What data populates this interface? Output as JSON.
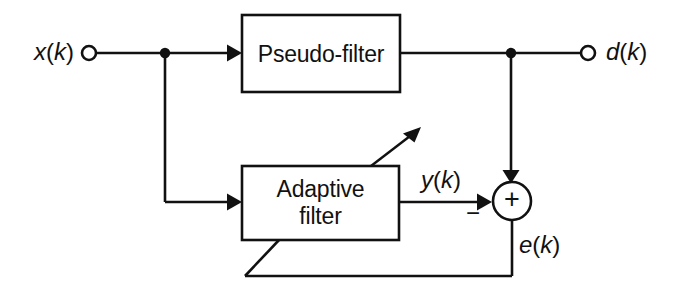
{
  "diagram": {
    "type": "block-diagram",
    "background_color": "#ffffff",
    "line_color": "#111111",
    "blocks": [
      {
        "id": "pseudo-filter",
        "label": "Pseudo-filter",
        "lines": [
          "Pseudo-filter"
        ],
        "x": 242,
        "y": 15,
        "width": 158,
        "height": 77
      },
      {
        "id": "adaptive-filter",
        "label": "Adaptive filter",
        "lines": [
          "Adaptive",
          "filter"
        ],
        "x": 242,
        "y": 166,
        "width": 157,
        "height": 74
      }
    ],
    "nodes": [
      {
        "id": "sum-junction",
        "symbol": "+",
        "sign_secondary": "−",
        "cx": 512,
        "cy": 201,
        "r": 19
      },
      {
        "id": "input-terminal",
        "symbol": "open-circle",
        "cx": 89,
        "cy": 53,
        "r": 7
      },
      {
        "id": "output-terminal",
        "symbol": "open-circle",
        "cx": 588,
        "cy": 53,
        "r": 7
      },
      {
        "id": "input-tap",
        "symbol": "filled-dot",
        "cx": 165,
        "cy": 53,
        "r": 5
      },
      {
        "id": "desired-tap",
        "symbol": "filled-dot",
        "cx": 511,
        "cy": 53,
        "r": 5
      }
    ],
    "signals": [
      {
        "id": "x-signal",
        "text": "x(k)",
        "italic_part": "x",
        "x": 34,
        "y": 38
      },
      {
        "id": "d-signal",
        "text": "d(k)",
        "italic_part": "d",
        "x": 606,
        "y": 38
      },
      {
        "id": "y-signal",
        "text": "y(k)",
        "italic_part": "y",
        "x": 421,
        "y": 166
      },
      {
        "id": "e-signal",
        "text": "e(k)",
        "italic_part": "e",
        "x": 519,
        "y": 231
      }
    ],
    "operator_signs": [
      {
        "id": "sum-plus",
        "text": "+",
        "x": 504,
        "y": 188
      },
      {
        "id": "sum-minus",
        "text": "−",
        "x": 466,
        "y": 203
      }
    ],
    "connections": [
      {
        "id": "input-to-tap",
        "from": "input-terminal",
        "to": "input-tap"
      },
      {
        "id": "tap-to-pseudo-filter",
        "from": "input-tap",
        "to": "pseudo-filter"
      },
      {
        "id": "tap-down-to-adaptive-filter",
        "from": "input-tap",
        "to": "adaptive-filter"
      },
      {
        "id": "pseudo-filter-to-desired-tap",
        "from": "pseudo-filter",
        "to": "desired-tap"
      },
      {
        "id": "desired-tap-to-output",
        "from": "desired-tap",
        "to": "output-terminal"
      },
      {
        "id": "desired-tap-to-sum",
        "from": "desired-tap",
        "to": "sum-junction"
      },
      {
        "id": "adaptive-filter-to-sum",
        "from": "adaptive-filter",
        "to": "sum-junction"
      },
      {
        "id": "error-feedback",
        "from": "sum-junction",
        "to": "adaptive-filter"
      },
      {
        "id": "adaptation-arrow",
        "from": "adaptive-filter",
        "to": "coefficient-update"
      }
    ]
  }
}
